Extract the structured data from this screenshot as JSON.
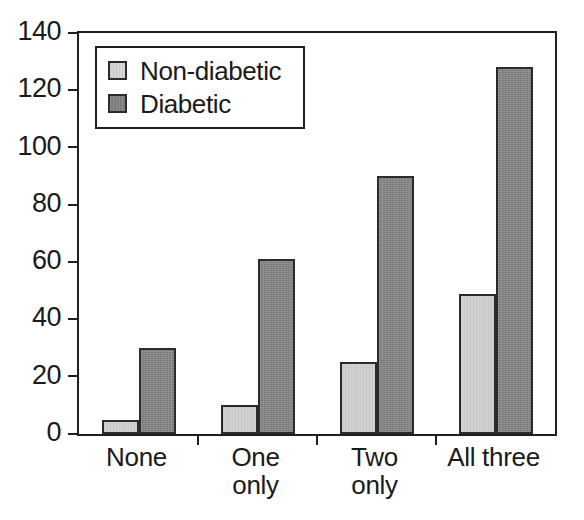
{
  "chart_data": {
    "type": "bar",
    "title": "",
    "subtitle": "",
    "xlabel": "",
    "ylabel": "",
    "categories": [
      "None",
      "One\nonly",
      "Two\nonly",
      "All three"
    ],
    "series": [
      {
        "name": "Non-diabetic",
        "color": "#d6d6d6",
        "values": [
          5,
          10,
          25,
          49
        ]
      },
      {
        "name": "Diabetic",
        "color": "#848484",
        "values": [
          30,
          61,
          90,
          128
        ]
      }
    ],
    "ylim": [
      0,
      140
    ],
    "yticks": [
      0,
      20,
      40,
      60,
      80,
      100,
      120,
      140
    ],
    "ytick_labels": [
      "0",
      "20",
      "40",
      "60",
      "80",
      "100",
      "120",
      "140"
    ],
    "grid": false,
    "legend_position": "top-left",
    "legend_entries": [
      "Non-diabetic",
      "Diabetic"
    ],
    "axis_color": "#1f1f1f",
    "bar_border_color": "#2b2b2b",
    "background": "#ffffff"
  }
}
